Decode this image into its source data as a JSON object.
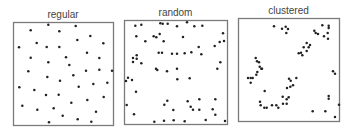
{
  "figure": {
    "background": "#ffffff",
    "frame_color": "#7a7a7a",
    "dot_color": "#222222",
    "title_color": "#444444"
  },
  "chart_data": [
    {
      "type": "scatter",
      "title": "regular",
      "xlabel": "",
      "ylabel": "",
      "grid": false,
      "legend": null,
      "box": {
        "left": 13,
        "top": 22,
        "right": 113,
        "bottom": 125
      },
      "points": [
        [
          30.7,
          30.3
        ],
        [
          48.3,
          24.7
        ],
        [
          59.3,
          31.3
        ],
        [
          75.7,
          26
        ],
        [
          90.3,
          36
        ],
        [
          77.3,
          40
        ],
        [
          103.3,
          43.3
        ],
        [
          36.7,
          43
        ],
        [
          19,
          47.3
        ],
        [
          46.7,
          47
        ],
        [
          59.3,
          47
        ],
        [
          87,
          52.7
        ],
        [
          30.7,
          57.7
        ],
        [
          66,
          57.3
        ],
        [
          99.3,
          58
        ],
        [
          48.3,
          62.3
        ],
        [
          69.3,
          65
        ],
        [
          28.3,
          71.3
        ],
        [
          86,
          70.7
        ],
        [
          99.3,
          69.7
        ],
        [
          112,
          70.7
        ],
        [
          47.3,
          77
        ],
        [
          60,
          80.7
        ],
        [
          73.3,
          75.3
        ],
        [
          19.3,
          87.3
        ],
        [
          34.3,
          90
        ],
        [
          46,
          95
        ],
        [
          58.7,
          94.7
        ],
        [
          78.7,
          86.7
        ],
        [
          93.3,
          84
        ],
        [
          107.3,
          82.7
        ],
        [
          71.3,
          102.7
        ],
        [
          87.3,
          100
        ],
        [
          103.7,
          97
        ],
        [
          22.3,
          105.7
        ],
        [
          37.3,
          109.7
        ],
        [
          53.7,
          108.3
        ],
        [
          62.7,
          115.7
        ],
        [
          77.7,
          119.3
        ],
        [
          96,
          111.7
        ],
        [
          49,
          122.3
        ],
        [
          91.3,
          121.7
        ]
      ]
    },
    {
      "type": "scatter",
      "title": "random",
      "xlabel": "",
      "ylabel": "",
      "grid": false,
      "legend": null,
      "box": {
        "left": 124,
        "top": 20,
        "right": 227,
        "bottom": 124
      },
      "points": [
        [
          135.3,
          25.7
        ],
        [
          141.3,
          24.7
        ],
        [
          160.3,
          23.3
        ],
        [
          162.7,
          23.7
        ],
        [
          167.7,
          23.7
        ],
        [
          177,
          26.3
        ],
        [
          187,
          22.3
        ],
        [
          194.3,
          26.3
        ],
        [
          202.3,
          25.7
        ],
        [
          136.3,
          36.3
        ],
        [
          153.7,
          36.3
        ],
        [
          156.3,
          37.3
        ],
        [
          159.7,
          34
        ],
        [
          145.3,
          41.3
        ],
        [
          163.7,
          41.3
        ],
        [
          183,
          37
        ],
        [
          223,
          33.3
        ],
        [
          219.7,
          42
        ],
        [
          224,
          41
        ],
        [
          214.7,
          46
        ],
        [
          198.7,
          47
        ],
        [
          158.7,
          52.7
        ],
        [
          162,
          52.7
        ],
        [
          172,
          53.7
        ],
        [
          177,
          53.7
        ],
        [
          184.7,
          53.3
        ],
        [
          191.3,
          52.3
        ],
        [
          201.3,
          54.3
        ],
        [
          136.7,
          55.3
        ],
        [
          136.7,
          58.7
        ],
        [
          133,
          58
        ],
        [
          133,
          62
        ],
        [
          141.3,
          63.3
        ],
        [
          220.3,
          62.3
        ],
        [
          217.3,
          68.7
        ],
        [
          156,
          68.7
        ],
        [
          157.3,
          70
        ],
        [
          177,
          68.7
        ],
        [
          167,
          71.3
        ],
        [
          128,
          77.7
        ],
        [
          132,
          80
        ],
        [
          126,
          81
        ],
        [
          136,
          91.7
        ],
        [
          177.3,
          79.3
        ],
        [
          189.7,
          78.3
        ],
        [
          126.7,
          105
        ],
        [
          134,
          114.3
        ],
        [
          167.3,
          100.7
        ],
        [
          164.3,
          104.7
        ],
        [
          173.3,
          110
        ],
        [
          187.7,
          101.3
        ],
        [
          190.7,
          106.7
        ],
        [
          193,
          109.7
        ],
        [
          199.3,
          99.3
        ],
        [
          199.3,
          109.7
        ],
        [
          215.3,
          99.3
        ],
        [
          212.7,
          109.3
        ],
        [
          215.3,
          114.7
        ],
        [
          154.3,
          121.7
        ],
        [
          164,
          120.7
        ],
        [
          173.7,
          120.3
        ],
        [
          184.7,
          121.3
        ],
        [
          205.7,
          120
        ],
        [
          225,
          121
        ]
      ]
    },
    {
      "type": "scatter",
      "title": "clustered",
      "xlabel": "",
      "ylabel": "",
      "grid": false,
      "legend": null,
      "box": {
        "left": 238,
        "top": 18,
        "right": 339,
        "bottom": 121
      },
      "points": [
        [
          274,
          26.3
        ],
        [
          282,
          28.7
        ],
        [
          285.7,
          26.7
        ],
        [
          288,
          29
        ],
        [
          286.3,
          33
        ],
        [
          314.3,
          30.7
        ],
        [
          315.7,
          33
        ],
        [
          318,
          34
        ],
        [
          322.3,
          25.3
        ],
        [
          328.7,
          25.7
        ],
        [
          328.7,
          28
        ],
        [
          327.7,
          33
        ],
        [
          324,
          36.3
        ],
        [
          328,
          38.7
        ],
        [
          306.7,
          43
        ],
        [
          310,
          45
        ],
        [
          303.7,
          47.3
        ],
        [
          308.7,
          47.3
        ],
        [
          306.7,
          51
        ],
        [
          298.7,
          53.3
        ],
        [
          302.3,
          55.3
        ],
        [
          301,
          52.7
        ],
        [
          255.7,
          58
        ],
        [
          257,
          61.3
        ],
        [
          259,
          62.3
        ],
        [
          259.7,
          66.7
        ],
        [
          261.3,
          68.7
        ],
        [
          262,
          68.7
        ],
        [
          257.3,
          72
        ],
        [
          256.3,
          74.7
        ],
        [
          248,
          78
        ],
        [
          250.7,
          78
        ],
        [
          252.7,
          78
        ],
        [
          250.7,
          82.7
        ],
        [
          289,
          78.7
        ],
        [
          290.7,
          80.7
        ],
        [
          296.3,
          78
        ],
        [
          293,
          85.3
        ],
        [
          287,
          88
        ],
        [
          290.3,
          86.7
        ],
        [
          333,
          71.3
        ],
        [
          335,
          73.7
        ],
        [
          264.7,
          91
        ],
        [
          282.7,
          96.7
        ],
        [
          288.7,
          97.3
        ],
        [
          286.7,
          99.3
        ],
        [
          260,
          101.7
        ],
        [
          260.7,
          105.3
        ],
        [
          264.3,
          107.7
        ],
        [
          266.7,
          107.7
        ],
        [
          272,
          105.3
        ],
        [
          276.3,
          105.3
        ],
        [
          278.3,
          107.7
        ],
        [
          283,
          103.7
        ],
        [
          286.7,
          103.7
        ],
        [
          328.7,
          96
        ],
        [
          328.7,
          98.7
        ],
        [
          339,
          104.7
        ],
        [
          312.7,
          111.3
        ],
        [
          325.3,
          111.3
        ],
        [
          335,
          117
        ]
      ]
    }
  ]
}
